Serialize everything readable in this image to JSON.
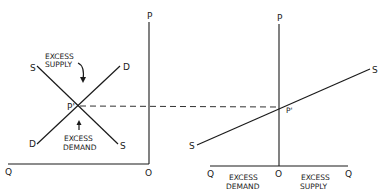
{
  "diagram": {
    "left_panel": {
      "axes": {
        "vertical_label": "P",
        "horizontal_label": "Q",
        "origin_label": "O"
      },
      "supply_curve": {
        "start_label": "S",
        "end_label": "S"
      },
      "demand_curve": {
        "start_label": "D",
        "end_label": "D"
      },
      "equilibrium_label": "P'",
      "annotations": [
        {
          "lines": [
            "EXCESS",
            "SUPPLY"
          ],
          "arrow": "down"
        },
        {
          "lines": [
            "EXCESS",
            "DEMAND"
          ],
          "arrow": "up"
        }
      ]
    },
    "right_panel": {
      "axes": {
        "vertical_label": "P",
        "left_label": "Q",
        "right_label": "Q",
        "origin_label": "O"
      },
      "excess_supply_curve": {
        "start_label": "S",
        "end_label": "S"
      },
      "equilibrium_label": "P'",
      "axis_regions": [
        {
          "lines": [
            "EXCESS",
            "DEMAND"
          ]
        },
        {
          "lines": [
            "EXCESS",
            "SUPPLY"
          ]
        }
      ]
    },
    "connector": {
      "style": "dashed",
      "from": "left P'",
      "to": "right P'"
    }
  }
}
